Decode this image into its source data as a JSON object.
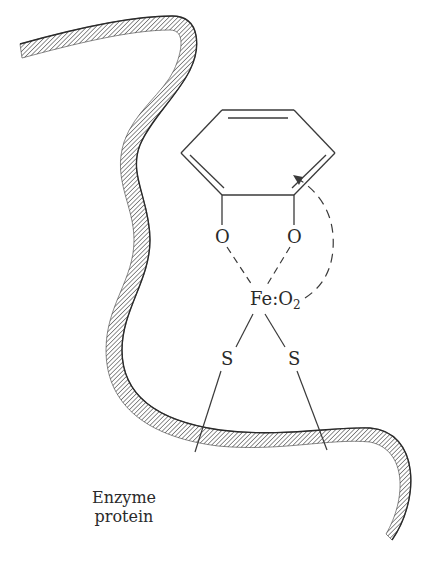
{
  "diagram": {
    "type": "schematic chemical diagram",
    "labels": {
      "oxygen_left": "O",
      "oxygen_right": "O",
      "iron": "Fe",
      "colon": ":",
      "o2_main": "O",
      "o2_sub": "2",
      "sulfur_left": "S",
      "sulfur_right": "S",
      "caption_line1": "Enzyme",
      "caption_line2": "protein"
    },
    "colors": {
      "line": "#3a3a3a",
      "hatch": "#555555",
      "background": "#ffffff"
    }
  }
}
